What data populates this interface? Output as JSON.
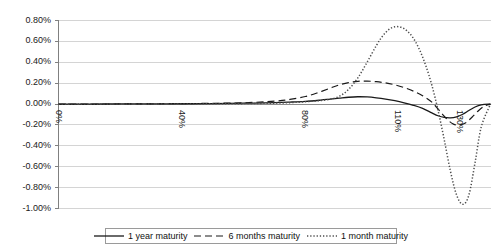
{
  "chart_data": {
    "type": "line",
    "title": "",
    "xlabel": "",
    "ylabel": "",
    "xlim": [
      0,
      140
    ],
    "ylim": [
      -1.0,
      0.8
    ],
    "grid": true,
    "y_tick_labels": [
      "0.80%",
      "0.60%",
      "0.40%",
      "0.20%",
      "0.00%",
      "-0.20%",
      "-0.40%",
      "-0.60%",
      "-0.80%",
      "-1.00%"
    ],
    "y_tick_values": [
      0.8,
      0.6,
      0.4,
      0.2,
      0.0,
      -0.2,
      -0.4,
      -0.6,
      -0.8,
      -1.0
    ],
    "x_tick_labels": [
      "0%",
      "40%",
      "80%",
      "110%",
      "130%"
    ],
    "x_tick_values": [
      0,
      40,
      80,
      110,
      130
    ],
    "x_tick_rotation": 90,
    "legend_position": "bottom",
    "series": [
      {
        "name": "1 year maturity",
        "style": "solid",
        "color": "#1a1a1a",
        "x": [
          0,
          10,
          20,
          30,
          40,
          50,
          60,
          70,
          75,
          80,
          85,
          88,
          91,
          94,
          97,
          100,
          103,
          106,
          109,
          112,
          115,
          118,
          121,
          123,
          125,
          127,
          129,
          131,
          133,
          135,
          137,
          140
        ],
        "values": [
          0.0,
          0.0,
          0.001,
          0.002,
          0.003,
          0.005,
          0.008,
          0.014,
          0.019,
          0.026,
          0.038,
          0.047,
          0.056,
          0.065,
          0.07,
          0.068,
          0.06,
          0.048,
          0.032,
          0.012,
          -0.012,
          -0.042,
          -0.085,
          -0.112,
          -0.128,
          -0.132,
          -0.122,
          -0.098,
          -0.062,
          -0.028,
          -0.008,
          0.0
        ]
      },
      {
        "name": "6 months maturity",
        "style": "dashed",
        "color": "#1a1a1a",
        "x": [
          0,
          10,
          20,
          30,
          40,
          50,
          60,
          70,
          75,
          80,
          84,
          88,
          91,
          94,
          97,
          100,
          103,
          106,
          109,
          112,
          115,
          118,
          121,
          124,
          126,
          128,
          130,
          132,
          134,
          136,
          138,
          140
        ],
        "values": [
          0.0,
          0.0,
          0.001,
          0.002,
          0.004,
          0.007,
          0.012,
          0.028,
          0.044,
          0.072,
          0.108,
          0.152,
          0.184,
          0.206,
          0.218,
          0.22,
          0.214,
          0.202,
          0.184,
          0.158,
          0.124,
          0.08,
          0.018,
          -0.082,
          -0.148,
          -0.192,
          -0.2,
          -0.178,
          -0.126,
          -0.066,
          -0.02,
          0.0
        ]
      },
      {
        "name": "1 month maturity",
        "style": "dotted",
        "color": "#4d4d4d",
        "x": [
          0,
          20,
          40,
          55,
          65,
          72,
          78,
          82,
          85,
          88,
          91,
          94,
          97,
          100,
          103,
          105,
          107,
          109,
          111,
          113,
          115,
          117,
          119,
          121,
          123,
          125,
          127,
          129,
          131,
          133,
          135,
          137,
          140
        ],
        "values": [
          0.0,
          0.0,
          0.001,
          0.003,
          0.006,
          0.01,
          0.018,
          0.026,
          0.034,
          0.046,
          0.074,
          0.14,
          0.25,
          0.4,
          0.56,
          0.65,
          0.712,
          0.74,
          0.735,
          0.7,
          0.63,
          0.52,
          0.37,
          0.18,
          -0.06,
          -0.34,
          -0.64,
          -0.87,
          -0.96,
          -0.87,
          -0.56,
          -0.22,
          0.0
        ]
      }
    ]
  },
  "legend": {
    "items": [
      {
        "label": "1 year maturity",
        "style": "solid"
      },
      {
        "label": "6 months maturity",
        "style": "dashed"
      },
      {
        "label": "1 month maturity",
        "style": "dotted"
      }
    ]
  }
}
